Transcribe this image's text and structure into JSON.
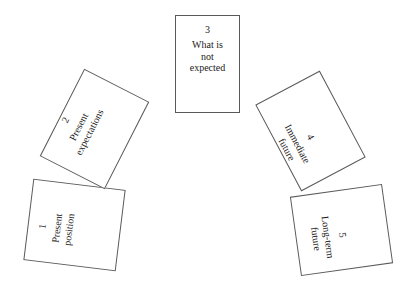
{
  "diagram": {
    "background_color": "#ffffff",
    "card_border_color": "#5a5a5a",
    "text_color": "#1a1a1a",
    "cards": [
      {
        "number": "1",
        "lines": [
          "Present",
          "position"
        ],
        "position": "lower-left",
        "rotation_deg": 7,
        "text_rotation_deg": -90
      },
      {
        "number": "2",
        "lines": [
          "Present",
          "expectations"
        ],
        "position": "upper-left",
        "rotation_deg": 27,
        "text_rotation_deg": -90
      },
      {
        "number": "3",
        "lines": [
          "What is",
          "not",
          "expected"
        ],
        "position": "top-center",
        "rotation_deg": 0,
        "text_rotation_deg": 0
      },
      {
        "number": "4",
        "lines": [
          "Immediate",
          "future"
        ],
        "position": "upper-right",
        "rotation_deg": -28,
        "text_rotation_deg": 90
      },
      {
        "number": "5",
        "lines": [
          "Long-term",
          "future"
        ],
        "position": "lower-right",
        "rotation_deg": -8,
        "text_rotation_deg": 90
      }
    ]
  }
}
